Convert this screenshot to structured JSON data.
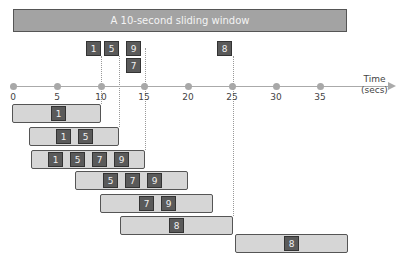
{
  "header": {
    "title": "A 10-second sliding window"
  },
  "axis": {
    "label_line1": "Time",
    "label_line2": "(secs)",
    "ticks": [
      "0",
      "5",
      "10",
      "15",
      "20",
      "25",
      "30",
      "35"
    ]
  },
  "events": [
    {
      "value": "1",
      "time": 10
    },
    {
      "value": "5",
      "time": 12
    },
    {
      "value": "9",
      "time": 15
    },
    {
      "value": "7",
      "time": 15
    },
    {
      "value": "8",
      "time": 25
    }
  ],
  "windows": [
    {
      "events": [
        "1"
      ]
    },
    {
      "events": [
        "1",
        "5"
      ]
    },
    {
      "events": [
        "1",
        "5",
        "7",
        "9"
      ]
    },
    {
      "events": [
        "5",
        "7",
        "9"
      ]
    },
    {
      "events": [
        "7",
        "9"
      ]
    },
    {
      "events": [
        "8"
      ]
    },
    {
      "events": [
        "8"
      ]
    }
  ],
  "colors": {
    "header_bg": "#a3a3a3",
    "event_bg": "#5a5a5a",
    "window_bg": "#d6d6d6"
  }
}
